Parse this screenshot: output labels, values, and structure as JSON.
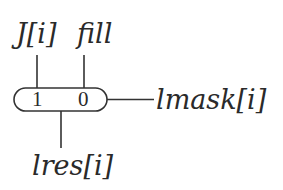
{
  "diagram": {
    "top_labels": [
      {
        "id": "j-index",
        "text": "J[i]"
      },
      {
        "id": "fill",
        "text": "fill"
      }
    ],
    "register": {
      "cells": [
        "1",
        "0"
      ]
    },
    "output_right": {
      "text": "lmask[i]"
    },
    "output_bottom": {
      "text": "lres[i]"
    },
    "colors": {
      "stroke": "#333333",
      "text": "#2a2a2a",
      "background": "#ffffff"
    }
  }
}
